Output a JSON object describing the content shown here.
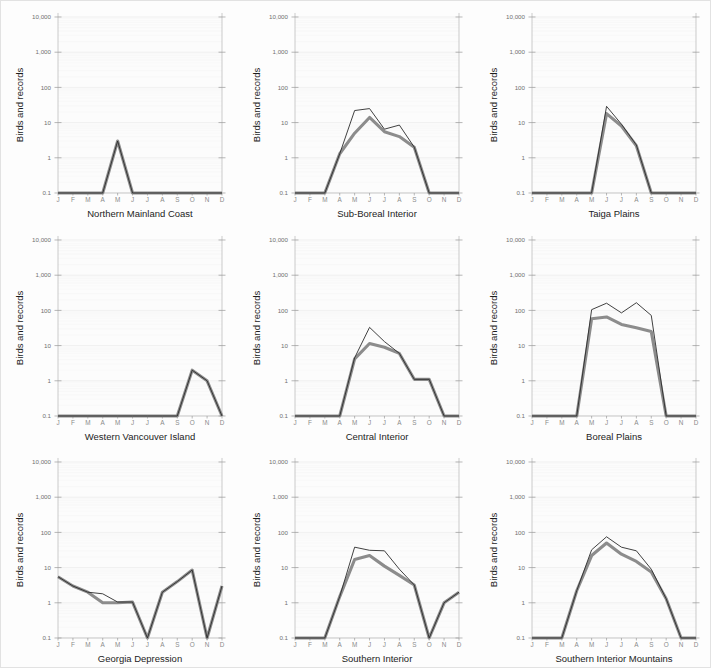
{
  "figure": {
    "background_color": "#fdfdfd",
    "border_color": "#e2e2e2",
    "rows": 3,
    "columns": 3
  },
  "axis": {
    "ylabel": "Birds and records",
    "ytick_labels": [
      "0.1",
      "1",
      "10",
      "100",
      "1,000",
      "10,000"
    ],
    "ytick_values": [
      0.1,
      1,
      10,
      100,
      1000,
      10000
    ],
    "xtick_labels": [
      "J",
      "F",
      "M",
      "A",
      "M",
      "J",
      "J",
      "A",
      "S",
      "O",
      "N",
      "D"
    ],
    "scale": "log",
    "ylim": [
      0.1,
      10000
    ],
    "grid": true
  },
  "series_style": {
    "records_line_color": "#2b2b2b",
    "records_line_width": 0.9,
    "birds_line_color": "#8c8c8c",
    "birds_line_width": 3.1
  },
  "chart_data": [
    {
      "type": "line",
      "title": "Northern Mainland Coast",
      "xlabel": "",
      "ylabel": "Birds and records",
      "categories": [
        "J",
        "F",
        "M",
        "A",
        "M",
        "J",
        "J",
        "A",
        "S",
        "O",
        "N",
        "D"
      ],
      "ylim": [
        0.1,
        10000
      ],
      "yscale": "log",
      "grid": true,
      "legend": "none",
      "series": [
        {
          "name": "records",
          "values": [
            0.1,
            0.1,
            0.1,
            0.1,
            3.0,
            0.1,
            0.1,
            0.1,
            0.1,
            0.1,
            0.1,
            0.1
          ]
        },
        {
          "name": "birds",
          "values": [
            0.1,
            0.1,
            0.1,
            0.1,
            3.0,
            0.1,
            0.1,
            0.1,
            0.1,
            0.1,
            0.1,
            0.1
          ]
        }
      ]
    },
    {
      "type": "line",
      "title": "Sub-Boreal Interior",
      "xlabel": "",
      "ylabel": "Birds and records",
      "categories": [
        "J",
        "F",
        "M",
        "A",
        "M",
        "J",
        "J",
        "A",
        "S",
        "O",
        "N",
        "D"
      ],
      "ylim": [
        0.1,
        10000
      ],
      "yscale": "log",
      "grid": true,
      "legend": "none",
      "series": [
        {
          "name": "records",
          "values": [
            0.1,
            0.1,
            0.1,
            1.3,
            22.0,
            25.0,
            6.5,
            8.5,
            2.0,
            0.1,
            0.1,
            0.1
          ]
        },
        {
          "name": "birds",
          "values": [
            0.1,
            0.1,
            0.1,
            1.3,
            5.0,
            14.0,
            5.5,
            4.0,
            2.0,
            0.1,
            0.1,
            0.1
          ]
        }
      ]
    },
    {
      "type": "line",
      "title": "Taiga Plains",
      "xlabel": "",
      "ylabel": "Birds and records",
      "categories": [
        "J",
        "F",
        "M",
        "A",
        "M",
        "J",
        "J",
        "A",
        "S",
        "O",
        "N",
        "D"
      ],
      "ylim": [
        0.1,
        10000
      ],
      "yscale": "log",
      "grid": true,
      "legend": "none",
      "series": [
        {
          "name": "records",
          "values": [
            0.1,
            0.1,
            0.1,
            0.1,
            0.1,
            29.0,
            9.0,
            2.3,
            0.1,
            0.1,
            0.1,
            0.1
          ]
        },
        {
          "name": "birds",
          "values": [
            0.1,
            0.1,
            0.1,
            0.1,
            0.1,
            18.0,
            8.0,
            2.2,
            0.1,
            0.1,
            0.1,
            0.1
          ]
        }
      ]
    },
    {
      "type": "line",
      "title": "Western Vancouver Island",
      "xlabel": "",
      "ylabel": "Birds and records",
      "categories": [
        "J",
        "F",
        "M",
        "A",
        "M",
        "J",
        "J",
        "A",
        "S",
        "O",
        "N",
        "D"
      ],
      "ylim": [
        0.1,
        10000
      ],
      "yscale": "log",
      "grid": true,
      "legend": "none",
      "series": [
        {
          "name": "records",
          "values": [
            0.1,
            0.1,
            0.1,
            0.1,
            0.1,
            0.1,
            0.1,
            0.1,
            0.1,
            2.0,
            1.0,
            0.1
          ]
        },
        {
          "name": "birds",
          "values": [
            0.1,
            0.1,
            0.1,
            0.1,
            0.1,
            0.1,
            0.1,
            0.1,
            0.1,
            2.0,
            1.0,
            0.1
          ]
        }
      ]
    },
    {
      "type": "line",
      "title": "Central Interior",
      "xlabel": "",
      "ylabel": "Birds and records",
      "categories": [
        "J",
        "F",
        "M",
        "A",
        "M",
        "J",
        "J",
        "A",
        "S",
        "O",
        "N",
        "D"
      ],
      "ylim": [
        0.1,
        10000
      ],
      "yscale": "log",
      "grid": true,
      "legend": "none",
      "series": [
        {
          "name": "records",
          "values": [
            0.1,
            0.1,
            0.1,
            0.1,
            4.5,
            33.0,
            13.0,
            6.0,
            1.1,
            1.1,
            0.1,
            0.1
          ]
        },
        {
          "name": "birds",
          "values": [
            0.1,
            0.1,
            0.1,
            0.1,
            4.2,
            11.5,
            9.0,
            6.0,
            1.1,
            1.1,
            0.1,
            0.1
          ]
        }
      ]
    },
    {
      "type": "line",
      "title": "Boreal Plains",
      "xlabel": "",
      "ylabel": "Birds and records",
      "categories": [
        "J",
        "F",
        "M",
        "A",
        "M",
        "J",
        "J",
        "A",
        "S",
        "O",
        "N",
        "D"
      ],
      "ylim": [
        0.1,
        10000
      ],
      "yscale": "log",
      "grid": true,
      "legend": "none",
      "series": [
        {
          "name": "records",
          "values": [
            0.1,
            0.1,
            0.1,
            0.1,
            105.0,
            160.0,
            85.0,
            165.0,
            72.0,
            0.1,
            0.1,
            0.1
          ]
        },
        {
          "name": "birds",
          "values": [
            0.1,
            0.1,
            0.1,
            0.1,
            58.0,
            65.0,
            40.0,
            32.0,
            25.0,
            0.1,
            0.1,
            0.1
          ]
        }
      ]
    },
    {
      "type": "line",
      "title": "Georgia Depression",
      "xlabel": "",
      "ylabel": "Birds and records",
      "categories": [
        "J",
        "F",
        "M",
        "A",
        "M",
        "J",
        "J",
        "A",
        "S",
        "O",
        "N",
        "D"
      ],
      "ylim": [
        0.1,
        10000
      ],
      "yscale": "log",
      "grid": true,
      "legend": "none",
      "series": [
        {
          "name": "records",
          "values": [
            5.5,
            3.0,
            2.0,
            1.8,
            1.05,
            1.05,
            0.1,
            2.0,
            4.0,
            8.5,
            0.1,
            3.0
          ]
        },
        {
          "name": "birds",
          "values": [
            5.5,
            3.0,
            2.0,
            1.0,
            1.0,
            1.05,
            0.1,
            2.0,
            4.0,
            8.5,
            0.1,
            3.0
          ]
        }
      ]
    },
    {
      "type": "line",
      "title": "Southern Interior",
      "xlabel": "",
      "ylabel": "Birds and records",
      "categories": [
        "J",
        "F",
        "M",
        "A",
        "M",
        "J",
        "J",
        "A",
        "S",
        "O",
        "N",
        "D"
      ],
      "ylim": [
        0.1,
        10000
      ],
      "yscale": "log",
      "grid": true,
      "legend": "none",
      "series": [
        {
          "name": "records",
          "values": [
            0.1,
            0.1,
            0.1,
            1.5,
            38.0,
            31.0,
            30.0,
            9.0,
            3.2,
            0.1,
            1.0,
            2.0
          ]
        },
        {
          "name": "birds",
          "values": [
            0.1,
            0.1,
            0.1,
            1.5,
            17.0,
            22.0,
            11.0,
            6.0,
            3.2,
            0.1,
            1.0,
            2.0
          ]
        }
      ]
    },
    {
      "type": "line",
      "title": "Southern Interior Mountains",
      "xlabel": "",
      "ylabel": "Birds and records",
      "categories": [
        "J",
        "F",
        "M",
        "A",
        "M",
        "J",
        "J",
        "A",
        "S",
        "O",
        "N",
        "D"
      ],
      "ylim": [
        0.1,
        10000
      ],
      "yscale": "log",
      "grid": true,
      "legend": "none",
      "series": [
        {
          "name": "records",
          "values": [
            0.1,
            0.1,
            0.1,
            2.2,
            32.0,
            75.0,
            38.0,
            30.0,
            9.0,
            1.3,
            0.1,
            0.1
          ]
        },
        {
          "name": "birds",
          "values": [
            0.1,
            0.1,
            0.1,
            2.2,
            22.0,
            50.0,
            24.0,
            15.0,
            7.5,
            1.3,
            0.1,
            0.1
          ]
        }
      ]
    }
  ]
}
